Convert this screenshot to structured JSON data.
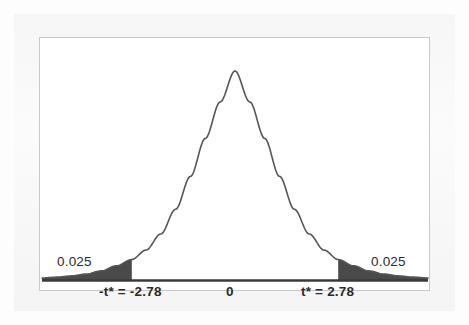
{
  "figure": {
    "kind": "t-distribution-critical-value-curve",
    "frame": {
      "border_color": "#c9c9c9",
      "background_color": "#ffffff"
    },
    "curve": {
      "line_color": "#555555",
      "line_width": 1.6
    },
    "tails": {
      "fill_color": "#4a4a4a"
    },
    "axis": {
      "line_color": "#3a3a3a"
    }
  },
  "labels": {
    "area_left": "0.025",
    "area_right": "0.025",
    "tick_left": "-t* = -2.78",
    "tick_center": "0",
    "tick_right": "t* = 2.78"
  },
  "chart_data": {
    "type": "line",
    "title": "",
    "xlabel": "",
    "ylabel": "",
    "distribution": "Student t",
    "grid": false,
    "legend": null,
    "xlim": [
      -5.2,
      5.2
    ],
    "ylim": [
      0,
      1.05
    ],
    "x_tick_values": [
      -2.78,
      0,
      2.78
    ],
    "x_tick_labels": [
      "-t* = -2.78",
      "0",
      "t* = 2.78"
    ],
    "critical_values": {
      "lower": -2.78,
      "upper": 2.78
    },
    "shaded_regions": [
      {
        "name": "left-tail",
        "from": -5.2,
        "to": -2.78,
        "area": 0.025,
        "label": "0.025"
      },
      {
        "name": "right-tail",
        "from": 2.78,
        "to": 5.2,
        "area": 0.025,
        "label": "0.025"
      }
    ],
    "series": [
      {
        "name": "t density",
        "x": [
          -5.2,
          -4.8,
          -4.4,
          -4.0,
          -3.6,
          -3.2,
          -2.78,
          -2.4,
          -2.0,
          -1.6,
          -1.2,
          -0.8,
          -0.4,
          0.0,
          0.4,
          0.8,
          1.2,
          1.6,
          2.0,
          2.4,
          2.78,
          3.2,
          3.6,
          4.0,
          4.4,
          4.8,
          5.2
        ],
        "y": [
          0.012,
          0.016,
          0.022,
          0.031,
          0.046,
          0.07,
          0.1,
          0.145,
          0.222,
          0.34,
          0.497,
          0.678,
          0.852,
          1.0,
          0.852,
          0.678,
          0.497,
          0.34,
          0.222,
          0.145,
          0.1,
          0.07,
          0.046,
          0.031,
          0.022,
          0.016,
          0.012
        ]
      }
    ]
  }
}
